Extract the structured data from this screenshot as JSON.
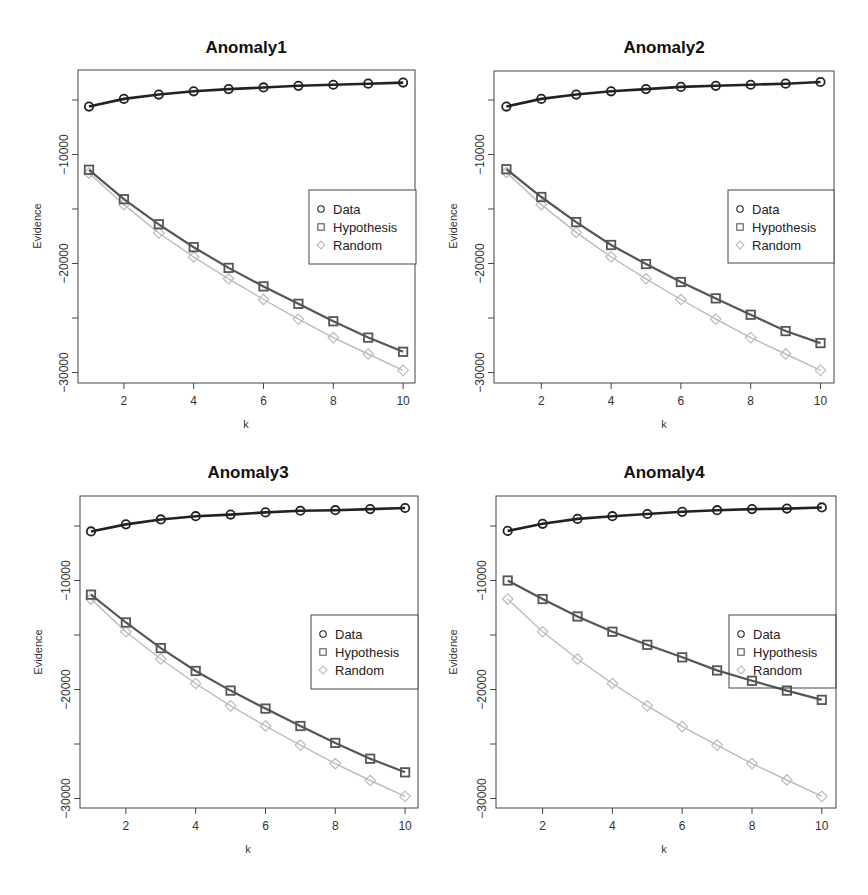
{
  "figure": {
    "panels": [
      {
        "title": "Anomaly1",
        "xlabel": "k",
        "ylabel": "Evidence"
      },
      {
        "title": "Anomaly2",
        "xlabel": "k",
        "ylabel": "Evidence"
      },
      {
        "title": "Anomaly3",
        "xlabel": "k",
        "ylabel": "Evidence"
      },
      {
        "title": "Anomaly4",
        "xlabel": "k",
        "ylabel": "Evidence"
      }
    ],
    "legend": {
      "entries": [
        {
          "label": "Data",
          "marker": "circle",
          "color": "#222222"
        },
        {
          "label": "Hypothesis",
          "marker": "square",
          "color": "#555555"
        },
        {
          "label": "Random",
          "marker": "diamond",
          "color": "#bbbbbb"
        }
      ]
    },
    "x_ticks": [
      "2",
      "4",
      "6",
      "8",
      "10"
    ],
    "y_ticks": [
      "-10000",
      "-20000",
      "-30000"
    ]
  },
  "chart_data": [
    {
      "type": "line",
      "title": "Anomaly1",
      "xlabel": "k",
      "ylabel": "Evidence",
      "x": [
        1,
        2,
        3,
        4,
        5,
        6,
        7,
        8,
        9,
        10
      ],
      "xticks": [
        2,
        4,
        6,
        8,
        10
      ],
      "yticks": [
        -10000,
        -20000,
        -30000
      ],
      "ylim": [
        -30900,
        -2300
      ],
      "grid": false,
      "legend_position": "right-center",
      "series": [
        {
          "name": "Data",
          "marker": "circle",
          "color": "#222222",
          "values": [
            -5600,
            -4900,
            -4500,
            -4200,
            -4000,
            -3850,
            -3700,
            -3600,
            -3500,
            -3400
          ]
        },
        {
          "name": "Hypothesis",
          "marker": "square",
          "color": "#555555",
          "values": [
            -11400,
            -14100,
            -16400,
            -18500,
            -20400,
            -22100,
            -23700,
            -25300,
            -26800,
            -28100
          ]
        },
        {
          "name": "Random",
          "marker": "diamond",
          "color": "#bbbbbb",
          "values": [
            -11700,
            -14600,
            -17200,
            -19400,
            -21400,
            -23300,
            -25100,
            -26800,
            -28300,
            -29800
          ]
        }
      ]
    },
    {
      "type": "line",
      "title": "Anomaly2",
      "xlabel": "k",
      "ylabel": "Evidence",
      "x": [
        1,
        2,
        3,
        4,
        5,
        6,
        7,
        8,
        9,
        10
      ],
      "xticks": [
        2,
        4,
        6,
        8,
        10
      ],
      "yticks": [
        -10000,
        -20000,
        -30000
      ],
      "ylim": [
        -30900,
        -2300
      ],
      "grid": false,
      "legend_position": "right-center",
      "series": [
        {
          "name": "Data",
          "marker": "circle",
          "color": "#222222",
          "values": [
            -5600,
            -4900,
            -4500,
            -4200,
            -4000,
            -3800,
            -3700,
            -3600,
            -3500,
            -3350
          ]
        },
        {
          "name": "Hypothesis",
          "marker": "square",
          "color": "#555555",
          "values": [
            -11350,
            -13900,
            -16200,
            -18300,
            -20050,
            -21700,
            -23200,
            -24700,
            -26200,
            -27300
          ]
        },
        {
          "name": "Random",
          "marker": "diamond",
          "color": "#bbbbbb",
          "values": [
            -11650,
            -14600,
            -17150,
            -19400,
            -21400,
            -23300,
            -25100,
            -26800,
            -28300,
            -29800
          ]
        }
      ]
    },
    {
      "type": "line",
      "title": "Anomaly3",
      "xlabel": "k",
      "ylabel": "Evidence",
      "x": [
        1,
        2,
        3,
        4,
        5,
        6,
        7,
        8,
        9,
        10
      ],
      "xticks": [
        2,
        4,
        6,
        8,
        10
      ],
      "yticks": [
        -10000,
        -20000,
        -30000
      ],
      "ylim": [
        -30900,
        -2300
      ],
      "grid": false,
      "legend_position": "right-center",
      "series": [
        {
          "name": "Data",
          "marker": "circle",
          "color": "#222222",
          "values": [
            -5500,
            -4850,
            -4400,
            -4100,
            -3950,
            -3750,
            -3600,
            -3550,
            -3450,
            -3350
          ]
        },
        {
          "name": "Hypothesis",
          "marker": "square",
          "color": "#555555",
          "values": [
            -11300,
            -13850,
            -16200,
            -18300,
            -20100,
            -21750,
            -23350,
            -24900,
            -26350,
            -27600
          ]
        },
        {
          "name": "Random",
          "marker": "diamond",
          "color": "#bbbbbb",
          "values": [
            -11700,
            -14700,
            -17200,
            -19450,
            -21500,
            -23350,
            -25100,
            -26800,
            -28350,
            -29800
          ]
        }
      ]
    },
    {
      "type": "line",
      "title": "Anomaly4",
      "xlabel": "k",
      "ylabel": "Evidence",
      "x": [
        1,
        2,
        3,
        4,
        5,
        6,
        7,
        8,
        9,
        10
      ],
      "xticks": [
        2,
        4,
        6,
        8,
        10
      ],
      "yticks": [
        -10000,
        -20000,
        -30000
      ],
      "ylim": [
        -30900,
        -2300
      ],
      "grid": false,
      "legend_position": "right-center",
      "series": [
        {
          "name": "Data",
          "marker": "circle",
          "color": "#222222",
          "values": [
            -5450,
            -4800,
            -4350,
            -4100,
            -3900,
            -3700,
            -3550,
            -3450,
            -3400,
            -3300
          ]
        },
        {
          "name": "Hypothesis",
          "marker": "square",
          "color": "#555555",
          "values": [
            -10000,
            -11700,
            -13300,
            -14700,
            -15900,
            -17050,
            -18250,
            -19200,
            -20100,
            -20950
          ]
        },
        {
          "name": "Random",
          "marker": "diamond",
          "color": "#bbbbbb",
          "values": [
            -11700,
            -14700,
            -17200,
            -19450,
            -21500,
            -23400,
            -25100,
            -26800,
            -28300,
            -29800
          ]
        }
      ]
    }
  ]
}
